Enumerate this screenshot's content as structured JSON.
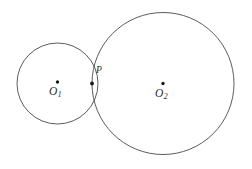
{
  "figure": {
    "kind": "geometry-diagram",
    "width": 252,
    "height": 169,
    "background_color": "#ffffff",
    "stroke_color": "#4a4a4a",
    "dot_color": "#1a1a1a",
    "label_color": "#2b2b2b"
  },
  "circles": [
    {
      "id": "circle-1",
      "name": "small-circle",
      "center_label": "O",
      "center_subscript": "1",
      "cx": 57.5,
      "cy": 83.5,
      "r": 40.5
    },
    {
      "id": "circle-2",
      "name": "large-circle",
      "center_label": "O",
      "center_subscript": "2",
      "cx": 163.0,
      "cy": 83.5,
      "r": 71.0
    }
  ],
  "points": [
    {
      "id": "point-o1",
      "name": "center-o1",
      "label": "O",
      "subscript": "1",
      "x": 57.5,
      "y": 82.0
    },
    {
      "id": "point-o2",
      "name": "center-o2",
      "label": "O",
      "subscript": "2",
      "x": 163.0,
      "y": 83.5
    },
    {
      "id": "point-p",
      "name": "tangency-point",
      "label": "P",
      "subscript": "",
      "x": 92.0,
      "y": 83.5
    }
  ]
}
